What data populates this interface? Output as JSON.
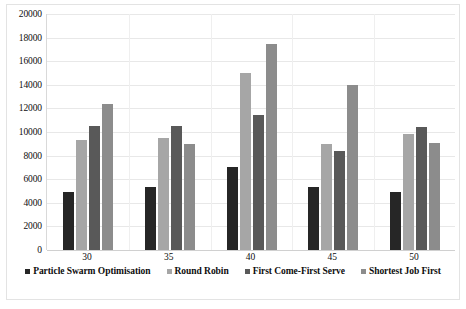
{
  "chart_data": {
    "type": "bar",
    "title": "",
    "subtitle": "",
    "xlabel": "",
    "ylabel": "",
    "categories": [
      "30",
      "35",
      "40",
      "45",
      "50"
    ],
    "ylim": [
      0,
      20000
    ],
    "ytick_step": 2000,
    "yticks": [
      "0",
      "2000",
      "4000",
      "6000",
      "8000",
      "10000",
      "12000",
      "14000",
      "16000",
      "18000",
      "20000"
    ],
    "grid": "horizontal",
    "legend_position": "bottom",
    "series": [
      {
        "name": "Particle Swarm Optimisation",
        "color": "#262626",
        "values": [
          4950,
          5350,
          7000,
          5300,
          4950
        ]
      },
      {
        "name": "Round Robin",
        "color": "#a6a6a6",
        "values": [
          9300,
          9500,
          15000,
          8950,
          9800
        ]
      },
      {
        "name": "First Come-First Serve",
        "color": "#595959",
        "values": [
          10550,
          10550,
          11450,
          8400,
          10400
        ]
      },
      {
        "name": "Shortest Job First",
        "color": "#8c8c8c",
        "values": [
          12400,
          9000,
          17450,
          14000,
          9100
        ]
      }
    ]
  },
  "style": {
    "background": "#ffffff",
    "gridline_color": "#e8e8e8",
    "axis_color": "#d9d9d9",
    "text_color": "#0d0d0d"
  }
}
